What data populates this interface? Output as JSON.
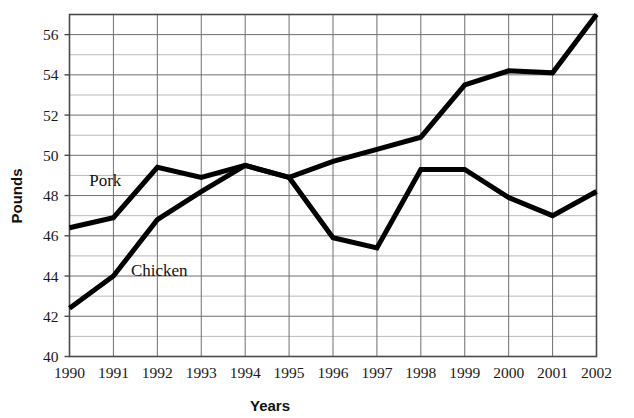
{
  "chart_data": {
    "type": "line",
    "title": "",
    "xlabel": "Years",
    "ylabel": "Pounds",
    "categories": [
      "1990",
      "1991",
      "1992",
      "1993",
      "1994",
      "1995",
      "1996",
      "1997",
      "1998",
      "1999",
      "2000",
      "2001",
      "2002"
    ],
    "x": [
      1990,
      1991,
      1992,
      1993,
      1994,
      1995,
      1996,
      1997,
      1998,
      1999,
      2000,
      2001,
      2002
    ],
    "xlim": [
      1990,
      2002
    ],
    "ylim": [
      40,
      57
    ],
    "ytick_labels": [
      "40",
      "42",
      "44",
      "46",
      "48",
      "50",
      "52",
      "54",
      "56"
    ],
    "yticks": [
      40,
      42,
      44,
      46,
      48,
      50,
      52,
      54,
      56
    ],
    "yminor": [
      41,
      43,
      45,
      47,
      49,
      51,
      53,
      55,
      57
    ],
    "grid": "both-axes-major-and-minor-horizontal",
    "legend": "inline-labels",
    "series": [
      {
        "name": "Pork",
        "label_text": "Pork",
        "values": [
          46.4,
          46.9,
          49.4,
          48.9,
          49.5,
          48.9,
          49.7,
          50.3,
          50.9,
          53.5,
          54.2,
          54.1,
          57.0
        ]
      },
      {
        "name": "Chicken",
        "label_text": "Chicken",
        "values": [
          42.4,
          44.0,
          46.8,
          48.2,
          49.5,
          48.9,
          45.9,
          45.4,
          49.3,
          49.3,
          47.9,
          47.0,
          48.2
        ]
      }
    ],
    "annotations": [
      {
        "text": "Pork",
        "x": 1990.45,
        "y": 48.5
      },
      {
        "text": "Chicken",
        "x": 1991.4,
        "y": 44.0
      }
    ],
    "colors": {
      "line": "#000000",
      "grid_major": "#6e6e6e",
      "grid_minor": "#b9b9b9",
      "background": "#ffffff",
      "text": "#111111"
    }
  }
}
